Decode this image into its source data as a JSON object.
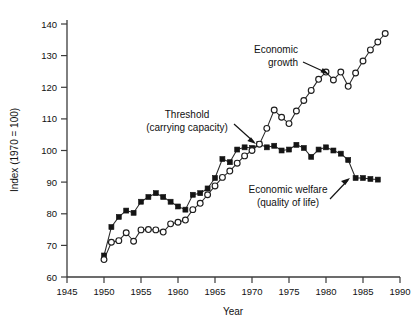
{
  "chart_data": {
    "type": "line",
    "title": "",
    "xlabel": "Year",
    "ylabel": "Index (1970 = 100)",
    "xlim": [
      1945,
      1990
    ],
    "ylim": [
      60,
      140
    ],
    "xticks": [
      1945,
      1950,
      1955,
      1960,
      1965,
      1970,
      1975,
      1980,
      1985,
      1990
    ],
    "yticks": [
      60,
      70,
      80,
      90,
      100,
      110,
      120,
      130,
      140
    ],
    "grid": false,
    "legend": "none (inline annotations)",
    "series": [
      {
        "name": "Economic growth",
        "marker": "open-circle",
        "x": [
          1950,
          1951,
          1952,
          1953,
          1954,
          1955,
          1956,
          1957,
          1958,
          1959,
          1960,
          1961,
          1962,
          1963,
          1964,
          1965,
          1966,
          1967,
          1968,
          1969,
          1970,
          1971,
          1972,
          1973,
          1974,
          1975,
          1976,
          1977,
          1978,
          1979,
          1980,
          1981,
          1982,
          1983,
          1984,
          1985,
          1986,
          1987,
          1988
        ],
        "values": [
          65.5,
          71.0,
          71.5,
          74.0,
          71.3,
          74.9,
          75.0,
          74.9,
          74.2,
          76.8,
          77.3,
          78.0,
          81.3,
          83.3,
          86.0,
          88.8,
          91.5,
          93.5,
          96.0,
          98.3,
          100.0,
          102.0,
          107.0,
          112.8,
          110.5,
          108.5,
          112.5,
          115.8,
          119.0,
          122.5,
          124.8,
          122.3,
          124.8,
          120.3,
          124.5,
          128.3,
          131.8,
          134.3,
          137.0
        ]
      },
      {
        "name": "Economic welfare (quality of life)",
        "marker": "filled-square",
        "x": [
          1950,
          1951,
          1952,
          1953,
          1954,
          1955,
          1956,
          1957,
          1958,
          1959,
          1960,
          1961,
          1962,
          1963,
          1964,
          1965,
          1966,
          1967,
          1968,
          1969,
          1970,
          1971,
          1972,
          1973,
          1974,
          1975,
          1976,
          1977,
          1978,
          1979,
          1980,
          1981,
          1982,
          1983,
          1984,
          1985,
          1986,
          1987
        ],
        "values": [
          66.8,
          75.8,
          79.0,
          81.0,
          80.3,
          83.8,
          85.3,
          86.5,
          85.3,
          83.8,
          82.3,
          81.3,
          86.0,
          86.5,
          88.0,
          91.3,
          97.3,
          96.3,
          100.3,
          101.0,
          100.8,
          102.0,
          101.0,
          101.5,
          100.0,
          100.3,
          101.8,
          100.8,
          98.0,
          100.3,
          101.0,
          100.0,
          99.0,
          97.0,
          91.3,
          91.3,
          91.0,
          90.8
        ]
      }
    ],
    "annotations": [
      {
        "id": "economic-growth",
        "text_lines": [
          "Economic",
          "growth"
        ],
        "points_to_series": "Economic growth",
        "points_to_year": 1972
      },
      {
        "id": "threshold",
        "text_lines": [
          "Threshold",
          "(carrying capacity)"
        ],
        "points_to_series": "Economic welfare (quality of life)",
        "points_to_year": 1971
      },
      {
        "id": "economic-welfare",
        "text_lines": [
          "Economic welfare",
          "(quality of life)"
        ],
        "points_to_series": "Economic welfare (quality of life)",
        "points_to_year": 1984
      }
    ]
  },
  "axes": {
    "x_title": "Year",
    "y_title": "Index (1970 = 100)",
    "x_tick_labels": [
      "1945",
      "1950",
      "1955",
      "1960",
      "1965",
      "1970",
      "1975",
      "1980",
      "1985",
      "1990"
    ],
    "y_tick_labels": [
      "60",
      "70",
      "80",
      "90",
      "100",
      "110",
      "120",
      "130",
      "140"
    ]
  },
  "annotations": {
    "growth_line1": "Economic",
    "growth_line2": "growth",
    "threshold_line1": "Threshold",
    "threshold_line2": "(carrying capacity)",
    "welfare_line1": "Economic welfare",
    "welfare_line2": "(quality of life)"
  },
  "colors": {
    "background": "#ffffff",
    "axis": "#3b3b3b",
    "line": "#2a2a2a",
    "marker_fill_open": "#ffffff",
    "marker_fill_closed": "#141414",
    "text": "#111111"
  }
}
